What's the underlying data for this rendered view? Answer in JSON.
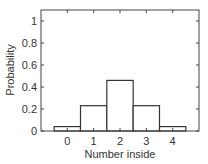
{
  "chart_data": {
    "type": "bar",
    "title": "",
    "xlabel": "Number inside",
    "ylabel": "Probability",
    "categories": [
      "0",
      "1",
      "2",
      "3",
      "4"
    ],
    "values": [
      0.04,
      0.23,
      0.46,
      0.23,
      0.04
    ],
    "ylim": [
      0,
      1.1
    ],
    "xlim": [
      -1,
      5
    ],
    "yticks": [
      "0",
      "0.2",
      "0.4",
      "0.6",
      "0.8",
      "1"
    ],
    "xticks": [
      "0",
      "1",
      "2",
      "3",
      "4"
    ],
    "grid": false,
    "legend": null,
    "bar_style": {
      "fill": "#ffffff",
      "edge": "#333333"
    }
  }
}
